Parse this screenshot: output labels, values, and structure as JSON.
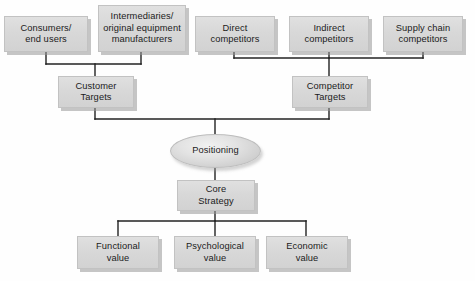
{
  "diagram": {
    "palette": {
      "background": "#fefefe",
      "box_fill": "#d8d8d8",
      "box_border": "#c2c2c2",
      "box_shadow": "#969696",
      "ellipse_fill": "#e3e3e3",
      "connector": "#222222",
      "text": "#1b1b1b"
    },
    "nodes": [
      {
        "id": "consumers",
        "label": "Consumers/\nend users",
        "shape": "box",
        "x": 4,
        "y": 16,
        "w": 84,
        "h": 36
      },
      {
        "id": "intermediaries",
        "label": "Intermediaries/\noriginal equipment\nmanufacturers",
        "shape": "box",
        "x": 98,
        "y": 5,
        "w": 88,
        "h": 47
      },
      {
        "id": "direct",
        "label": "Direct\ncompetitors",
        "shape": "box",
        "x": 195,
        "y": 16,
        "w": 80,
        "h": 36
      },
      {
        "id": "indirect",
        "label": "Indirect\ncompetitors",
        "shape": "box",
        "x": 289,
        "y": 16,
        "w": 80,
        "h": 36
      },
      {
        "id": "supply",
        "label": "Supply chain\ncompetitors",
        "shape": "box",
        "x": 383,
        "y": 16,
        "w": 80,
        "h": 36
      },
      {
        "id": "customer",
        "label": "Customer\nTargets",
        "shape": "box",
        "x": 58,
        "y": 76,
        "w": 76,
        "h": 32
      },
      {
        "id": "competitor",
        "label": "Competitor\nTargets",
        "shape": "box",
        "x": 292,
        "y": 76,
        "w": 76,
        "h": 32
      },
      {
        "id": "positioning",
        "label": "Positioning",
        "shape": "ellipse",
        "x": 170,
        "y": 134,
        "w": 91,
        "h": 34
      },
      {
        "id": "core",
        "label": "Core\nStrategy",
        "shape": "box",
        "x": 177,
        "y": 180,
        "w": 78,
        "h": 31
      },
      {
        "id": "functional",
        "label": "Functional\nvalue",
        "shape": "box",
        "x": 77,
        "y": 236,
        "w": 82,
        "h": 33
      },
      {
        "id": "psychological",
        "label": "Psychological\nvalue",
        "shape": "box",
        "x": 174,
        "y": 236,
        "w": 82,
        "h": 33
      },
      {
        "id": "economic",
        "label": "Economic\nvalue",
        "shape": "box",
        "x": 266,
        "y": 236,
        "w": 82,
        "h": 33
      }
    ],
    "connectors": [
      {
        "id": "consumers-to-bar",
        "points": "46,52 46,64"
      },
      {
        "id": "intermediaries-to-bar",
        "points": "141,52 141,64"
      },
      {
        "id": "customer-bar",
        "points": "46,64 141,64"
      },
      {
        "id": "bar-to-customer",
        "points": "95,64 95,76"
      },
      {
        "id": "direct-to-bar",
        "points": "234,52 234,58"
      },
      {
        "id": "indirect-to-bar",
        "points": "329,52 329,58"
      },
      {
        "id": "supply-to-bar",
        "points": "423,52 423,58"
      },
      {
        "id": "competitor-bar",
        "points": "234,58 423,58"
      },
      {
        "id": "bar-to-competitor",
        "points": "329,58 329,76"
      },
      {
        "id": "customer-down",
        "points": "95,108 95,119"
      },
      {
        "id": "competitor-down",
        "points": "329,108 329,119"
      },
      {
        "id": "mid-bar",
        "points": "95,119 329,119"
      },
      {
        "id": "mid-to-positioning",
        "points": "215,119 215,136"
      },
      {
        "id": "positioning-to-core",
        "points": "215,166 215,180"
      },
      {
        "id": "core-down",
        "points": "215,211 215,221"
      },
      {
        "id": "value-bar",
        "points": "118,221 306,221"
      },
      {
        "id": "bar-to-functional",
        "points": "118,221 118,236"
      },
      {
        "id": "bar-to-psychological",
        "points": "215,221 215,236"
      },
      {
        "id": "bar-to-economic",
        "points": "306,221 306,236"
      }
    ]
  }
}
